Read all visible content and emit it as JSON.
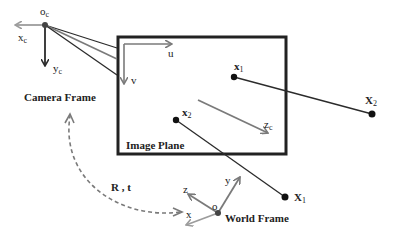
{
  "diagram": {
    "type": "pinhole-camera-projection",
    "colors": {
      "dark": "#2b2b2b",
      "gray": "#7a7a7a",
      "light_gray": "#9c9c9c",
      "frame_border": "#222222",
      "point": "#111111"
    },
    "camera": {
      "origin_label": "o",
      "origin_sub": "c",
      "x_label": "x",
      "x_sub": "c",
      "y_label": "y",
      "y_sub": "c",
      "z_label": "z",
      "z_sub": "c",
      "frame_label": "Camera Frame"
    },
    "image_plane": {
      "label": "Image Plane",
      "u_label": "u",
      "v_label": "v"
    },
    "image_points": [
      {
        "label": "x",
        "sub": "1"
      },
      {
        "label": "x",
        "sub": "2"
      }
    ],
    "world_points": [
      {
        "label": "X",
        "sub": "1"
      },
      {
        "label": "X",
        "sub": "2"
      }
    ],
    "world": {
      "origin_label": "o",
      "x_label": "x",
      "y_label": "y",
      "z_label": "z",
      "frame_label": "World Frame"
    },
    "transform_label": "R , t"
  }
}
